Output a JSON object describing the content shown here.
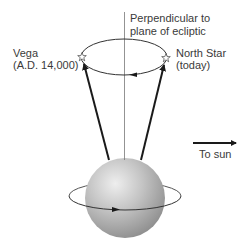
{
  "diagram": {
    "labels": {
      "axis_line1": "Perpendicular to",
      "axis_line2": "plane of ecliptic",
      "vega_name": "Vega",
      "vega_date": "(A.D. 14,000)",
      "north_name": "North Star",
      "north_date": "(today)",
      "sun": "To sun"
    },
    "icons": {
      "star": "star-outline-icon",
      "arrow": "arrow-icon"
    },
    "colors": {
      "line": "#1a1a1a",
      "thin_line": "#555555",
      "sphere_light": "#e6e6e6",
      "sphere_dark": "#8c8c8c",
      "text": "#3a3a3a"
    }
  }
}
